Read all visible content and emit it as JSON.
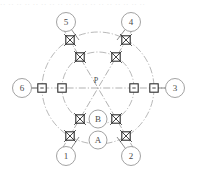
{
  "figure": {
    "width": 197,
    "height": 174,
    "header_text": "·· ·· ·· ·· ·· ·· ·· ·· ·· ·· ·· ·· ·· ·· ·· ·· ·· ··",
    "background_color": "#ffffff"
  },
  "geometry": {
    "center": {
      "x": 98,
      "y": 88,
      "label": "P"
    },
    "outer_circle": {
      "radius": 56,
      "style": "dash-dot",
      "color": "#9a9a9a"
    },
    "inner_circle": {
      "radius": 36,
      "style": "dash-dot",
      "color": "#9a9a9a"
    },
    "angular_step_degrees": 60,
    "axis_color": "#8f8f8f"
  },
  "center_label": {
    "text": "P",
    "offset_x": -2,
    "offset_y": -5
  },
  "point_labels": [
    {
      "id": "label-b",
      "text": "B",
      "x": 98,
      "y": 119,
      "radius": 9
    },
    {
      "id": "label-a",
      "text": "A",
      "x": 98,
      "y": 140,
      "radius": 9
    }
  ],
  "nodes": [
    {
      "id": "node-1",
      "label": "1",
      "cx": 66,
      "cy": 156,
      "radius": 9.5,
      "angle_degrees": 240,
      "leader_to": {
        "x": 79,
        "y": 137
      },
      "marker_type": "hatched"
    },
    {
      "id": "node-2",
      "label": "2",
      "cx": 131,
      "cy": 156,
      "radius": 9.5,
      "angle_degrees": 300,
      "leader_to": {
        "x": 117,
        "y": 137
      },
      "marker_type": "hatched"
    },
    {
      "id": "node-3",
      "label": "3",
      "cx": 175,
      "cy": 88,
      "radius": 9.5,
      "angle_degrees": 0,
      "leader_to": {
        "x": 154,
        "y": 88
      },
      "marker_type": "plain"
    },
    {
      "id": "node-4",
      "label": "4",
      "cx": 131,
      "cy": 22,
      "radius": 9.5,
      "angle_degrees": 60,
      "leader_to": {
        "x": 117,
        "y": 40
      },
      "marker_type": "hatched"
    },
    {
      "id": "node-5",
      "label": "5",
      "cx": 66,
      "cy": 22,
      "radius": 9.5,
      "angle_degrees": 120,
      "leader_to": {
        "x": 79,
        "y": 40
      },
      "marker_type": "hatched"
    },
    {
      "id": "node-6",
      "label": "6",
      "cx": 22,
      "cy": 88,
      "radius": 9.5,
      "angle_degrees": 180,
      "leader_to": {
        "x": 42,
        "y": 88
      },
      "marker_type": "plain"
    }
  ],
  "outer_markers": [
    {
      "id": "outer-marker-0",
      "x": 154,
      "y": 88,
      "type": "plain",
      "angle_degrees": 0
    },
    {
      "id": "outer-marker-60",
      "x": 126,
      "y": 40,
      "type": "hatched",
      "angle_degrees": 60
    },
    {
      "id": "outer-marker-120",
      "x": 70,
      "y": 40,
      "type": "hatched",
      "angle_degrees": 120
    },
    {
      "id": "outer-marker-180",
      "x": 42,
      "y": 88,
      "type": "plain",
      "angle_degrees": 180
    },
    {
      "id": "outer-marker-240",
      "x": 70,
      "y": 136,
      "type": "hatched",
      "angle_degrees": 240
    },
    {
      "id": "outer-marker-300",
      "x": 126,
      "y": 136,
      "type": "hatched",
      "angle_degrees": 300
    }
  ],
  "inner_markers": [
    {
      "id": "inner-marker-0",
      "x": 134,
      "y": 88,
      "type": "plain",
      "angle_degrees": 0
    },
    {
      "id": "inner-marker-60",
      "x": 116,
      "y": 57,
      "type": "hatched",
      "angle_degrees": 60
    },
    {
      "id": "inner-marker-120",
      "x": 80,
      "y": 57,
      "type": "hatched",
      "angle_degrees": 120
    },
    {
      "id": "inner-marker-180",
      "x": 62,
      "y": 88,
      "type": "plain",
      "angle_degrees": 180
    },
    {
      "id": "inner-marker-240",
      "x": 80,
      "y": 119,
      "type": "hatched",
      "angle_degrees": 240
    },
    {
      "id": "inner-marker-300",
      "x": 116,
      "y": 119,
      "type": "hatched",
      "angle_degrees": 300
    }
  ],
  "axes": [
    {
      "id": "axis-horizontal",
      "x1": 30,
      "y1": 88,
      "x2": 166,
      "y2": 88
    },
    {
      "id": "axis-diagonal-60",
      "x1": 62,
      "y1": 149,
      "x2": 134,
      "y2": 27
    },
    {
      "id": "axis-diagonal-120",
      "x1": 134,
      "y1": 149,
      "x2": 62,
      "y2": 27
    }
  ]
}
